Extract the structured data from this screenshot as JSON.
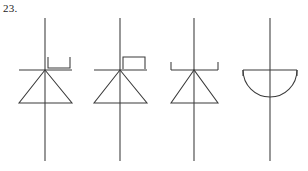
{
  "figure": {
    "label": "23.",
    "kind": "electronic-schematic-symbol-row",
    "background_color": "#ffffff",
    "line_color": "#3a3a3a",
    "label_color": "#1a1a1a"
  },
  "symbols": [
    {
      "index": 1,
      "name": "schottky-diode-right-hook",
      "label": "",
      "body": "triangle",
      "bar_marking": "down-u-bracket-right",
      "center_x": 45,
      "lead_top_y": 18,
      "lead_bottom_y": 161,
      "bar_y": 70,
      "bar_x1": 19,
      "bar_x2": 72,
      "tri_base_y": 103,
      "tri_x1": 19,
      "tri_x2": 72,
      "marking": {
        "start_x": 48,
        "top_y": 57,
        "bottom_y": 68,
        "end_x": 70
      }
    },
    {
      "index": 2,
      "name": "schottky-diode-up-bracket-right",
      "label": "",
      "body": "triangle",
      "bar_marking": "up-square-bracket-right",
      "center_x": 120,
      "lead_top_y": 18,
      "lead_bottom_y": 161,
      "bar_y": 70,
      "bar_x1": 94,
      "bar_x2": 147,
      "tri_base_y": 103,
      "tri_x1": 94,
      "tri_x2": 147,
      "marking": {
        "start_x": 123,
        "top_y": 57,
        "bottom_y": 69,
        "end_x": 145
      }
    },
    {
      "index": 3,
      "name": "schottky-diode-both-ends-up",
      "label": "",
      "body": "triangle",
      "bar_marking": "up-ticks-both-ends",
      "center_x": 194,
      "lead_top_y": 18,
      "lead_bottom_y": 161,
      "bar_y": 70,
      "bar_x1": 171,
      "bar_x2": 218,
      "tri_base_y": 103,
      "tri_x1": 171,
      "tri_x2": 218,
      "marking": {
        "tick_top_y": 62,
        "left_x": 171,
        "right_x": 218
      }
    },
    {
      "index": 4,
      "name": "semicircle-diode",
      "label": "",
      "body": "semicircle",
      "bar_marking": "down-ticks-both-ends",
      "center_x": 270,
      "lead_top_y": 18,
      "lead_bottom_y": 161,
      "bar_y": 70,
      "bar_x1": 243,
      "bar_x2": 297,
      "arc_bottom_y": 97,
      "marking": {
        "tick_bottom_y": 76,
        "left_x": 243,
        "right_x": 297
      }
    }
  ]
}
